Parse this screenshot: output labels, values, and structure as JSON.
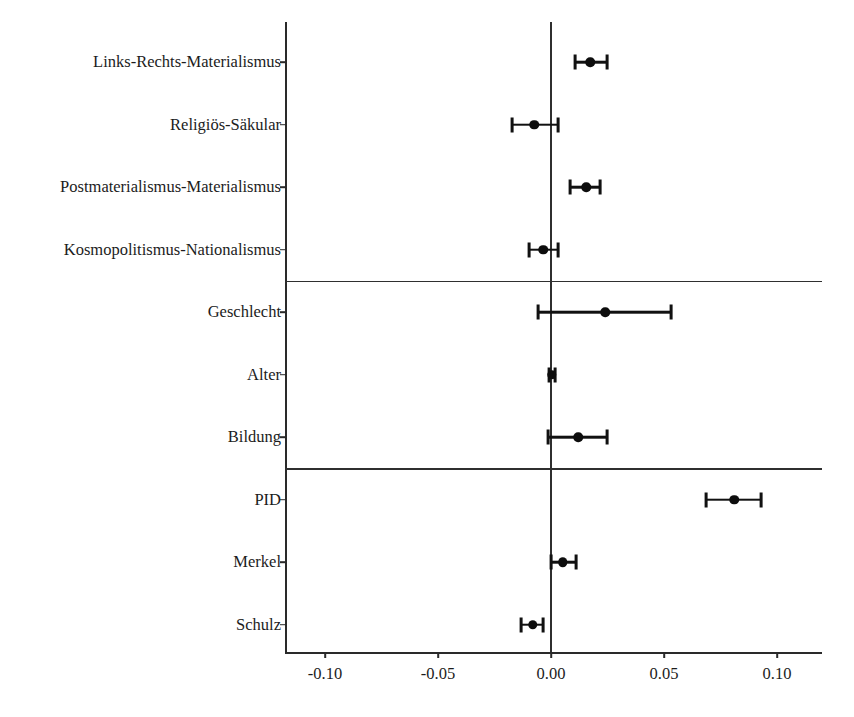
{
  "chart_data": {
    "type": "scatter",
    "subtype": "coefficient-plot",
    "title": "",
    "xlabel": "",
    "ylabel": "",
    "xlim": [
      -0.125,
      0.12
    ],
    "xticks": [
      -0.1,
      -0.05,
      0.0,
      0.05,
      0.1
    ],
    "xticklabels": [
      "-0.10",
      "-0.05",
      "0.00",
      "0.05",
      "0.10"
    ],
    "grid": false,
    "legend": false,
    "zero_reference_line": 0.0,
    "group_separators": [
      4,
      7
    ],
    "categories": [
      "Links-Rechts-Materialismus",
      "Religiös-Säkular",
      "Postmaterialismus-Materialismus",
      "Kosmopolitismus-Nationalismus",
      "Geschlecht",
      "Alter",
      "Bildung",
      "PID",
      "Merkel",
      "Schulz"
    ],
    "estimates": [
      0.0173,
      -0.0075,
      0.0155,
      -0.0035,
      0.0239,
      0.0004,
      0.012,
      0.081,
      0.0053,
      -0.008
    ],
    "ci_low": [
      0.0106,
      -0.0173,
      0.0084,
      -0.0097,
      -0.0058,
      -0.0009,
      -0.0013,
      0.0686,
      0.0,
      -0.0133
    ],
    "ci_high": [
      0.0248,
      0.0031,
      0.0217,
      0.0031,
      0.0531,
      0.0018,
      0.0248,
      0.0929,
      0.0111,
      -0.0035
    ]
  },
  "axis": {
    "tick_labels": [
      "-0.10",
      "-0.05",
      "0.00",
      "0.05",
      "0.10"
    ]
  },
  "rows": [
    {
      "label": "Links-Rechts-Materialismus"
    },
    {
      "label": "Religiös-Säkular"
    },
    {
      "label": "Postmaterialismus-Materialismus"
    },
    {
      "label": "Kosmopolitismus-Nationalismus"
    },
    {
      "label": "Geschlecht"
    },
    {
      "label": "Alter"
    },
    {
      "label": "Bildung"
    },
    {
      "label": "PID"
    },
    {
      "label": "Merkel"
    },
    {
      "label": "Schulz"
    }
  ],
  "colors": {
    "marker": "#0d0d0d",
    "line": "#2f2f2f",
    "text": "#1c1c1c",
    "background": "#ffffff"
  }
}
